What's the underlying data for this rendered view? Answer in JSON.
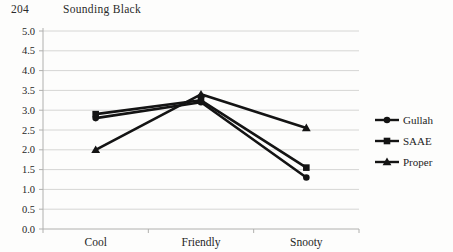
{
  "page": {
    "page_number": "204",
    "running_title": "Sounding Black"
  },
  "chart_data": {
    "type": "line",
    "categories": [
      "Cool",
      "Friendly",
      "Snooty"
    ],
    "series": [
      {
        "name": "Gullah",
        "marker": "circle",
        "values": [
          2.8,
          3.2,
          1.3
        ]
      },
      {
        "name": "SAAE",
        "marker": "square",
        "values": [
          2.9,
          3.25,
          1.55
        ]
      },
      {
        "name": "Proper",
        "marker": "triangle",
        "values": [
          2.0,
          3.4,
          2.55
        ]
      }
    ],
    "ylim": [
      0,
      5
    ],
    "ytick_step": 0.5,
    "ytick_labels": [
      "0.0",
      "0.5",
      "1.0",
      "1.5",
      "2.0",
      "2.5",
      "3.0",
      "3.5",
      "4.0",
      "4.5",
      "5.0"
    ],
    "xlabel": "",
    "ylabel": "",
    "title": "",
    "grid": true,
    "legend_position": "right",
    "line_color": "#141414",
    "gridline_color": "#d6d6d4",
    "axis_color": "#b0b0ae",
    "text_color": "#262626"
  }
}
